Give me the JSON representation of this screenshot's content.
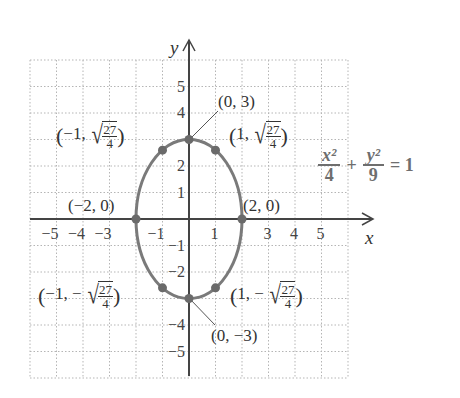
{
  "chart_data": {
    "type": "line",
    "title": "",
    "xlabel": "x",
    "ylabel": "y",
    "xlim": [
      -6,
      6
    ],
    "ylim": [
      -6,
      6
    ],
    "grid": true,
    "grid_style": "dotted",
    "x_ticks": [
      "-5",
      "-4",
      "-3",
      "-1",
      "1",
      "3",
      "4",
      "5"
    ],
    "y_ticks": [
      "5",
      "4",
      "2",
      "1",
      "-1",
      "-2",
      "-4",
      "-5"
    ],
    "equation": {
      "x_term_num": "x²",
      "x_term_den": "4",
      "plus": "+",
      "y_term_num": "y²",
      "y_term_den": "9",
      "rhs": "= 1"
    },
    "series": [
      {
        "name": "ellipse x^2/4 + y^2/9 = 1",
        "shape": "ellipse",
        "center": [
          0,
          0
        ],
        "a": 2,
        "b": 3,
        "color": "#7a7a7a"
      }
    ],
    "points": [
      {
        "x": 0,
        "y": 3,
        "label": "(0, 3)"
      },
      {
        "x": 0,
        "y": -3,
        "label": "(0, −3)"
      },
      {
        "x": -2,
        "y": 0,
        "label": "(−2, 0)"
      },
      {
        "x": 2,
        "y": 0,
        "label": "(2, 0)"
      },
      {
        "x": -1,
        "y": 2.598,
        "label": "(−1, √(27/4))"
      },
      {
        "x": 1,
        "y": 2.598,
        "label": "(1, √(27/4))"
      },
      {
        "x": -1,
        "y": -2.598,
        "label": "(−1, −√(27/4))"
      },
      {
        "x": 1,
        "y": -2.598,
        "label": "(1, −√(27/4))"
      }
    ]
  },
  "labels": {
    "axis_x": "x",
    "axis_y": "y",
    "p_top": "(0, 3)",
    "p_bottom": "(0, −3)",
    "p_left": "(−2, 0)",
    "p_right": "(2, 0)",
    "neg1": "−1,",
    "pos1": "1,",
    "minus": "−",
    "sqrt_num": "27",
    "sqrt_den": "4",
    "open": "(",
    "close": ")"
  },
  "ticks": {
    "x": [
      {
        "t": "−5",
        "v": -5
      },
      {
        "t": "−4",
        "v": -4
      },
      {
        "t": "−3",
        "v": -3
      },
      {
        "t": "−1",
        "v": -1
      },
      {
        "t": "1",
        "v": 1
      },
      {
        "t": "3",
        "v": 3
      },
      {
        "t": "4",
        "v": 4
      },
      {
        "t": "5",
        "v": 5
      }
    ],
    "y": [
      {
        "t": "5",
        "v": 5
      },
      {
        "t": "4",
        "v": 4
      },
      {
        "t": "2",
        "v": 2
      },
      {
        "t": "1",
        "v": 1
      },
      {
        "t": "−1",
        "v": -1
      },
      {
        "t": "−2",
        "v": -2
      },
      {
        "t": "−4",
        "v": -4
      },
      {
        "t": "−5",
        "v": -5
      }
    ]
  },
  "colors": {
    "curve": "#7a7a7a",
    "point": "#6a6a6a",
    "axis": "#444444",
    "grid": "#b5b5b5",
    "equation": "#6e6e6e"
  }
}
